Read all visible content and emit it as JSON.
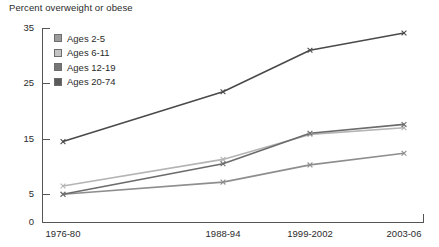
{
  "chart_data": {
    "type": "line",
    "title": "Percent overweight or obese",
    "xlabel": "",
    "ylabel": "",
    "categories": [
      "1976-80",
      "1988-94",
      "1999-2002",
      "2003-06"
    ],
    "ylim": [
      0,
      35
    ],
    "yticks": [
      0,
      5,
      15,
      25,
      35
    ],
    "ytick_labels": [
      "0",
      "5",
      "15",
      "25",
      "35"
    ],
    "grid": false,
    "legend_position": "upper-left-inside",
    "series": [
      {
        "name": "Ages 2-5",
        "color": "#8e8e8e",
        "swatch_color": "#9b9b9b",
        "values": [
          5.0,
          7.2,
          10.3,
          12.4
        ]
      },
      {
        "name": "Ages 6-11",
        "color": "#b4b4b4",
        "swatch_color": "#c4c4c4",
        "values": [
          6.5,
          11.3,
          15.8,
          17.0
        ]
      },
      {
        "name": "Ages 12-19",
        "color": "#6b6b6b",
        "swatch_color": "#767676",
        "values": [
          5.0,
          10.5,
          16.0,
          17.6
        ]
      },
      {
        "name": "Ages 20-74",
        "color": "#4a4a4a",
        "swatch_color": "#5a5a5a",
        "values": [
          14.5,
          23.5,
          31.0,
          34.1
        ]
      }
    ]
  },
  "axis": {
    "line_color": "#555555"
  }
}
